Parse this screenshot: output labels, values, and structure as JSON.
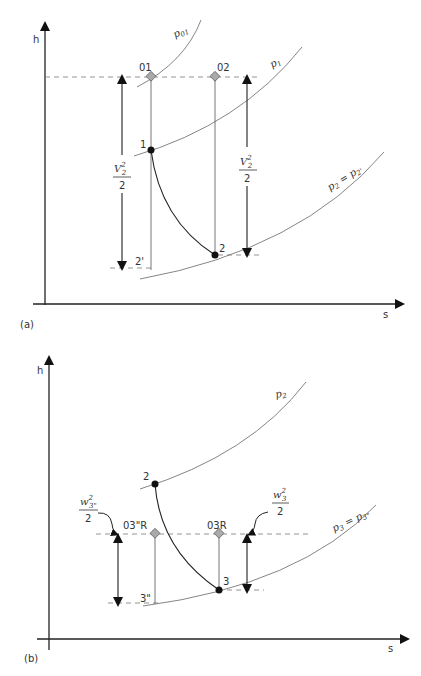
{
  "panel_a": {
    "tag": "(a)",
    "y_axis": "h",
    "x_axis": "s",
    "curves": {
      "p01": "p",
      "p01_sub": "01",
      "p1": "p",
      "p1_sub": "1",
      "p2": "p",
      "p2_sub": "2",
      "p2_eq": " = p",
      "p2_eq_sub": "2'"
    },
    "points": {
      "pt01": "01",
      "pt02": "02",
      "pt1": "1",
      "pt2": "2",
      "pt2p": "2'"
    },
    "energy_left": {
      "num": "V",
      "sup": "2",
      "sub": "2",
      "den": "2"
    },
    "energy_right": {
      "num": "V",
      "sup": "2",
      "sub": "2",
      "den": "2"
    }
  },
  "panel_b": {
    "tag": "(b)",
    "y_axis": "h",
    "x_axis": "s",
    "curves": {
      "p2": "p",
      "p2_sub": "2",
      "p3": "p",
      "p3_sub": "3",
      "p3_eq": " = p",
      "p3_eq_sub": "3\""
    },
    "points": {
      "pt2": "2",
      "pt3": "3",
      "pt3pp": "3\"",
      "pt03ppR": "03\"R",
      "pt03R": "03R"
    },
    "energy_left": {
      "num": "w",
      "sup": "2",
      "sub": "3\"",
      "den": "2"
    },
    "energy_right": {
      "num": "w",
      "sup": "2",
      "sub": "3",
      "den": "2"
    }
  }
}
